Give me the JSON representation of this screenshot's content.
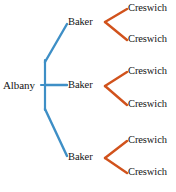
{
  "diagram": {
    "type": "tree",
    "title": "",
    "colors": {
      "level1_branch": "#3e8fc6",
      "level2_branch": "#d1521c",
      "text": "#141414",
      "background": "#ffffff"
    },
    "root": {
      "label": "Albany",
      "x": 22,
      "y": 85
    },
    "level2": [
      {
        "label": "Baker",
        "x": 82,
        "y": 22
      },
      {
        "label": "Baker",
        "x": 82,
        "y": 85
      },
      {
        "label": "Baker",
        "x": 82,
        "y": 157
      }
    ],
    "level3": [
      {
        "label": "Creswich",
        "x": 144,
        "y": 9,
        "parent": 0
      },
      {
        "label": "Creswich",
        "x": 144,
        "y": 39,
        "parent": 0
      },
      {
        "label": "Creswich",
        "x": 144,
        "y": 72,
        "parent": 1
      },
      {
        "label": "Creswich",
        "x": 144,
        "y": 104,
        "parent": 1
      },
      {
        "label": "Creswich",
        "x": 144,
        "y": 140,
        "parent": 2
      },
      {
        "label": "Creswich",
        "x": 144,
        "y": 172,
        "parent": 2
      }
    ],
    "caption": ""
  }
}
